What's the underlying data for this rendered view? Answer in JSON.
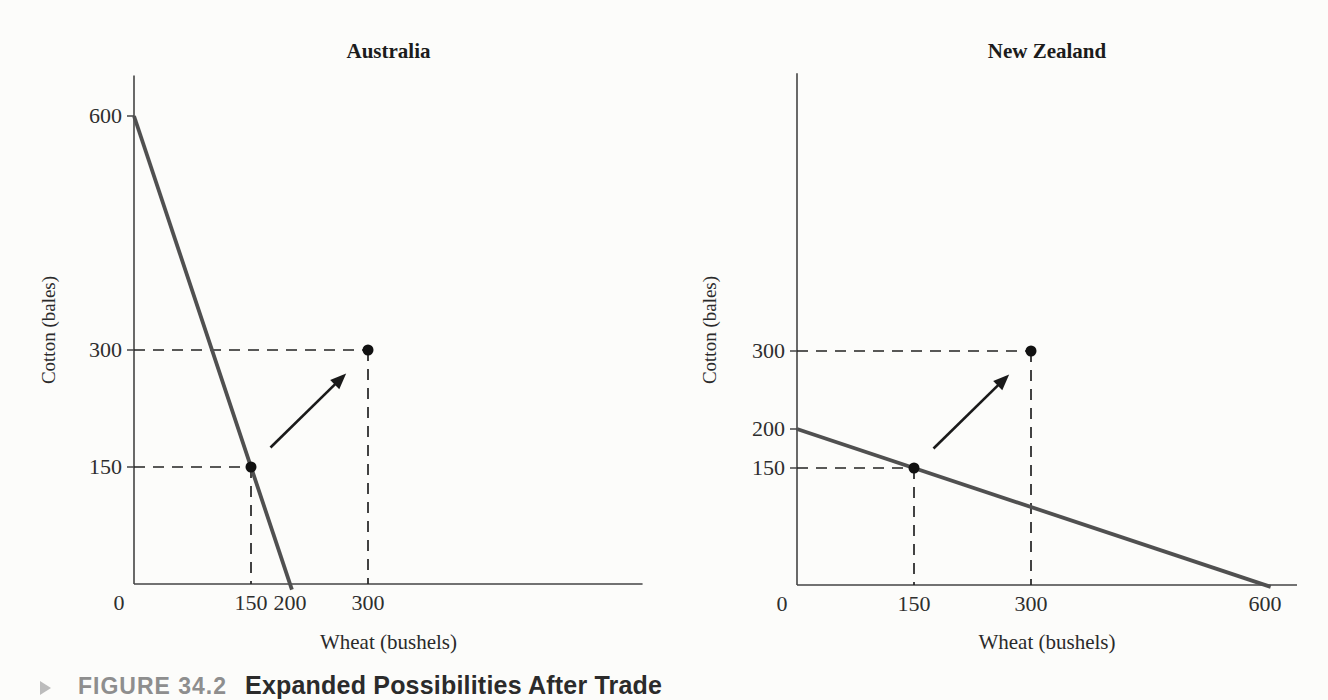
{
  "figure": {
    "kind": "textbook economics figure, two production-possibility charts side by side"
  },
  "caption": {
    "label": "FIGURE 34.2",
    "title": "Expanded Possibilities After Trade",
    "marker_icon": "triangle-right-icon"
  },
  "colors": {
    "background": "#fcfcfa",
    "axis": "#444444",
    "frontier": "#505050",
    "guides": "#222222",
    "points": "#111111",
    "arrow": "#1a1a1a",
    "tick_text": "#2e2e2e",
    "caption_label": "#8e8e8e",
    "caption_title": "#2b2b2b"
  },
  "chart_data": [
    {
      "type": "line",
      "title": "Australia",
      "xlabel": "Wheat (bushels)",
      "ylabel": "Cotton (bales)",
      "xlim": [
        0,
        652
      ],
      "ylim": [
        0,
        652
      ],
      "grid": false,
      "legend": "none",
      "xticks": [
        {
          "value": 0,
          "label": "0"
        },
        {
          "value": 150,
          "label": "150"
        },
        {
          "value": 200,
          "label": "200"
        },
        {
          "value": 300,
          "label": "300"
        }
      ],
      "yticks": [
        {
          "value": 600,
          "label": "600"
        },
        {
          "value": 300,
          "label": "300"
        },
        {
          "value": 150,
          "label": "150"
        }
      ],
      "series": [
        {
          "name": "production-possibility-frontier",
          "x": [
            0,
            200
          ],
          "y": [
            600,
            0
          ]
        }
      ],
      "points": [
        {
          "x": 150,
          "y": 150,
          "meaning": "pre-trade production point"
        },
        {
          "x": 300,
          "y": 300,
          "meaning": "post-trade consumption point"
        }
      ],
      "arrow": {
        "from": [
          175,
          175
        ],
        "to": [
          272,
          270
        ],
        "meaning": "expansion from (150,150) to (300,300)"
      }
    },
    {
      "type": "line",
      "title": "New Zealand",
      "xlabel": "Wheat (bushels)",
      "ylabel": "Cotton (bales)",
      "xlim": [
        0,
        641
      ],
      "ylim": [
        0,
        656
      ],
      "grid": false,
      "legend": "none",
      "xticks": [
        {
          "value": 0,
          "label": "0"
        },
        {
          "value": 150,
          "label": "150"
        },
        {
          "value": 300,
          "label": "300"
        },
        {
          "value": 600,
          "label": "600"
        }
      ],
      "yticks": [
        {
          "value": 300,
          "label": "300"
        },
        {
          "value": 200,
          "label": "200"
        },
        {
          "value": 150,
          "label": "150"
        }
      ],
      "series": [
        {
          "name": "production-possibility-frontier",
          "x": [
            0,
            600
          ],
          "y": [
            200,
            0
          ]
        }
      ],
      "points": [
        {
          "x": 150,
          "y": 150,
          "meaning": "pre-trade production point"
        },
        {
          "x": 300,
          "y": 300,
          "meaning": "post-trade consumption point"
        }
      ],
      "arrow": {
        "from": [
          175,
          175
        ],
        "to": [
          272,
          270
        ],
        "meaning": "expansion from (150,150) to (300,300)"
      }
    }
  ]
}
